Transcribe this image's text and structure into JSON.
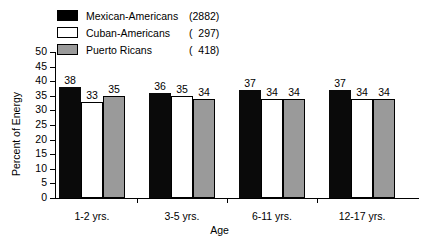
{
  "chart_data": {
    "type": "bar",
    "title": "",
    "xlabel": "Age",
    "ylabel": "Percent of Energy",
    "ylim": [
      0,
      50
    ],
    "ytick_values": [
      0,
      5,
      10,
      15,
      20,
      25,
      30,
      35,
      40,
      45,
      50
    ],
    "ytick_labels": [
      "0",
      "5",
      "10",
      "15",
      "20",
      "25",
      "30",
      "35",
      "40",
      "45",
      "50"
    ],
    "grid": false,
    "legend_position": "top-left",
    "categories": [
      "1-2 yrs.",
      "3-5 yrs.",
      "6-11 yrs.",
      "12-17 yrs."
    ],
    "series": [
      {
        "name": "Mexican-Americans",
        "count_label": "(2882)",
        "color": "#000000",
        "values": [
          38,
          36,
          37,
          37
        ]
      },
      {
        "name": "Cuban-Americans",
        "count_label": "(  297)",
        "color": "#ffffff",
        "values": [
          33,
          35,
          34,
          34
        ]
      },
      {
        "name": "Puerto Ricans",
        "count_label": "(  418)",
        "color": "#9a9a9a",
        "values": [
          35,
          34,
          34,
          34
        ]
      }
    ]
  },
  "legend": {
    "rows": [
      {
        "label": "Mexican-Americans",
        "count": "(2882)",
        "swatch": "black-swatch-icon"
      },
      {
        "label": "Cuban-Americans",
        "count": "(  297)",
        "swatch": "white-swatch-icon"
      },
      {
        "label": "Puerto Ricans",
        "count": "(  418)",
        "swatch": "gray-swatch-icon"
      }
    ]
  }
}
